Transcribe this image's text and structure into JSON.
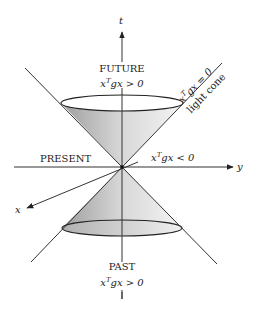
{
  "diagram": {
    "title": "Light cone",
    "axes": {
      "t_label": "t",
      "y_label": "y",
      "x_label": "x"
    },
    "regions": {
      "future": {
        "label": "FUTURE",
        "condition_base": "x",
        "condition_sup": "T",
        "condition_rest": "gx > 0"
      },
      "present": {
        "label": "PRESENT",
        "condition_base": "x",
        "condition_sup": "T",
        "condition_rest": "gx < 0"
      },
      "past": {
        "label": "PAST",
        "condition_base": "x",
        "condition_sup": "T",
        "condition_rest": "gx > 0"
      }
    },
    "light_cone": {
      "condition_base": "x",
      "condition_sup": "T",
      "condition_rest": "gx = 0",
      "label": "light cone"
    },
    "colors": {
      "line": "#222222",
      "cone_dark": "#a8a8a8",
      "cone_light": "#f2f2f2"
    }
  }
}
